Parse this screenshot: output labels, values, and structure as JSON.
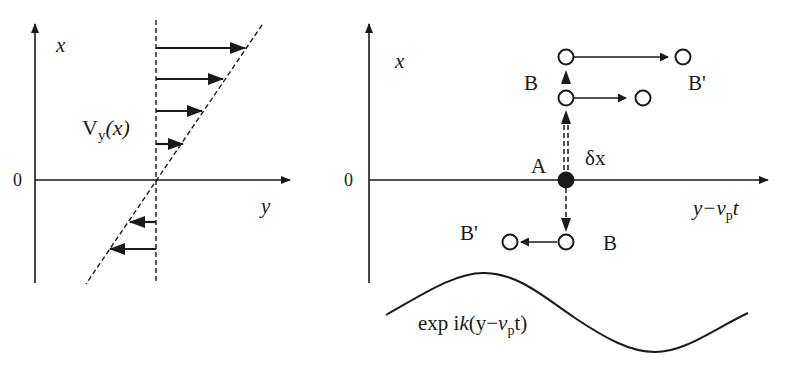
{
  "left_panel": {
    "axis_x_label": "x",
    "axis_y_label": "y",
    "origin_label": "0",
    "velocity_label_main": "V",
    "velocity_label_sub": "y",
    "velocity_label_arg": "(x)"
  },
  "right_panel": {
    "axis_x_label": "x",
    "axis_y_label_main": "y−",
    "axis_y_label_v": "v",
    "axis_y_label_sub": "p",
    "axis_y_label_t": "t",
    "origin_label": "0",
    "point_a_label": "A",
    "displacement_label": "δx",
    "point_b_upper_label": "B",
    "point_b_prime_upper_label": "B'",
    "point_b_lower_label": "B",
    "point_b_prime_lower_label": "B'",
    "wave_label_prefix": "exp i",
    "wave_label_k": "k",
    "wave_label_open": "(y−",
    "wave_label_v": "v",
    "wave_label_sub": "p",
    "wave_label_close": "t)"
  },
  "colors": {
    "ink": "#1a1a1a",
    "background": "#ffffff"
  }
}
